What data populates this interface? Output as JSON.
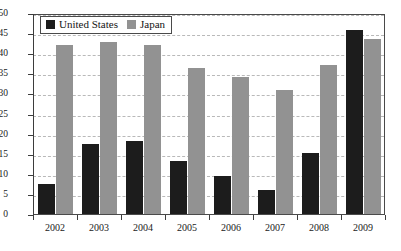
{
  "chart_data": {
    "type": "bar",
    "title": "",
    "subtitle": "",
    "xlabel": "",
    "ylabel": "",
    "categories": [
      "2002",
      "2003",
      "2004",
      "2005",
      "2006",
      "2007",
      "2008",
      "2009"
    ],
    "series": [
      {
        "name": "United States",
        "color": "#1c1c1c",
        "values": [
          7.5,
          17.5,
          18.2,
          13.2,
          9.4,
          6.0,
          15.1,
          45.8
        ]
      },
      {
        "name": "Japan",
        "color": "#929292",
        "values": [
          42.0,
          42.8,
          42.0,
          36.2,
          34.0,
          30.8,
          37.0,
          43.5
        ]
      }
    ],
    "ylim": [
      0,
      50
    ],
    "ytick_values": [
      0,
      5,
      10,
      15,
      20,
      25,
      30,
      35,
      40,
      45,
      50
    ],
    "ytick_labels": [
      "0",
      "5",
      "10",
      "15",
      "20",
      "25",
      "30",
      "35",
      "40",
      "45",
      "50"
    ],
    "grid": true,
    "grid_style": "dashed-horizontal",
    "legend_position": "top-left",
    "axis_color": "#3d3d3d",
    "gridline_color": "#b9b9b9",
    "background": "#ffffff"
  },
  "legend": {
    "entries": [
      {
        "label": "United States",
        "swatch": "legend-swatch-us"
      },
      {
        "label": "Japan",
        "swatch": "legend-swatch-jp"
      }
    ]
  }
}
